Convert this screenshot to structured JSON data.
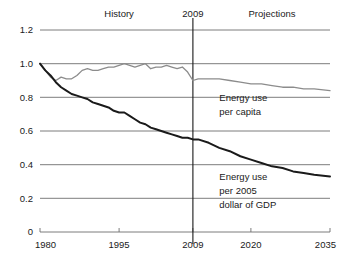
{
  "chart_data": {
    "type": "line",
    "title": "",
    "subtitle": "",
    "xlabel": "",
    "ylabel": "",
    "xlim": [
      1980,
      2035
    ],
    "ylim": [
      0,
      1.2
    ],
    "grid": true,
    "legend_position": "inline-annotations",
    "x_ticks": [
      "1980",
      "1995",
      "2009",
      "2020",
      "2035"
    ],
    "x_tick_values": [
      1980,
      1995,
      2009,
      2020,
      2035
    ],
    "y_ticks": [
      "0",
      "0.2",
      "0.4",
      "0.6",
      "0.8",
      "1.0",
      "1.2"
    ],
    "y_tick_values": [
      0,
      0.2,
      0.4,
      0.6,
      0.8,
      1.0,
      1.2
    ],
    "region_labels": [
      {
        "name": "history-label",
        "text": "History",
        "x": 1995
      },
      {
        "name": "divider-label",
        "text": "2009",
        "x": 2009
      },
      {
        "name": "projections-label",
        "text": "Projections",
        "x": 2024
      }
    ],
    "divider_year": 2009,
    "annotations": [
      {
        "name": "energy-per-capita-annotation",
        "lines": [
          "Energy use",
          "per capita"
        ],
        "x": 2014,
        "y": 0.78
      },
      {
        "name": "energy-per-gdp-annotation",
        "lines": [
          "Energy use",
          "per 2005",
          "dollar of GDP"
        ],
        "x": 2014,
        "y": 0.31
      }
    ],
    "series": [
      {
        "name": "Energy use per capita",
        "color": "#8c8c8c",
        "x": [
          1980,
          1981,
          1982,
          1983,
          1984,
          1985,
          1986,
          1987,
          1988,
          1989,
          1990,
          1991,
          1992,
          1993,
          1994,
          1995,
          1996,
          1997,
          1998,
          1999,
          2000,
          2001,
          2002,
          2003,
          2004,
          2005,
          2006,
          2007,
          2008,
          2009,
          2010,
          2012,
          2014,
          2016,
          2018,
          2020,
          2022,
          2024,
          2026,
          2028,
          2030,
          2032,
          2035
        ],
        "values": [
          1.0,
          0.96,
          0.92,
          0.9,
          0.92,
          0.91,
          0.91,
          0.93,
          0.96,
          0.97,
          0.96,
          0.96,
          0.97,
          0.98,
          0.98,
          0.99,
          1.0,
          0.99,
          0.98,
          0.99,
          1.0,
          0.97,
          0.98,
          0.98,
          0.99,
          0.98,
          0.97,
          0.98,
          0.95,
          0.9,
          0.91,
          0.91,
          0.91,
          0.9,
          0.89,
          0.88,
          0.88,
          0.87,
          0.86,
          0.86,
          0.85,
          0.85,
          0.84
        ]
      },
      {
        "name": "Energy use per 2005 dollar of GDP",
        "color": "#1a1a1a",
        "x": [
          1980,
          1981,
          1982,
          1983,
          1984,
          1985,
          1986,
          1987,
          1988,
          1989,
          1990,
          1991,
          1992,
          1993,
          1994,
          1995,
          1996,
          1997,
          1998,
          1999,
          2000,
          2001,
          2002,
          2003,
          2004,
          2005,
          2006,
          2007,
          2008,
          2009,
          2010,
          2012,
          2014,
          2016,
          2018,
          2020,
          2022,
          2024,
          2026,
          2028,
          2030,
          2032,
          2035
        ],
        "values": [
          1.0,
          0.96,
          0.93,
          0.89,
          0.86,
          0.84,
          0.82,
          0.81,
          0.8,
          0.79,
          0.77,
          0.76,
          0.75,
          0.74,
          0.72,
          0.71,
          0.71,
          0.69,
          0.67,
          0.65,
          0.64,
          0.62,
          0.61,
          0.6,
          0.59,
          0.58,
          0.57,
          0.56,
          0.56,
          0.55,
          0.55,
          0.53,
          0.5,
          0.48,
          0.45,
          0.43,
          0.41,
          0.39,
          0.38,
          0.36,
          0.35,
          0.34,
          0.33
        ]
      }
    ]
  }
}
